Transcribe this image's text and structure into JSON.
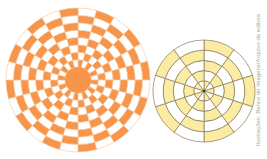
{
  "figures": {
    "left_wheel": {
      "center_color": "#f7964a",
      "fill_color": "#f7964a",
      "line_color": "#f3c49a",
      "rings": 8,
      "sectors": 24,
      "radius": 72,
      "center_radius": 13
    },
    "right_wheel": {
      "fill_color": "#fbeca3",
      "line_color": "#8a7a55",
      "rings": 5,
      "sectors": 10,
      "radius": 51
    }
  },
  "credit": "Ilustrações: Banco de imagens/Arquivo da editora"
}
